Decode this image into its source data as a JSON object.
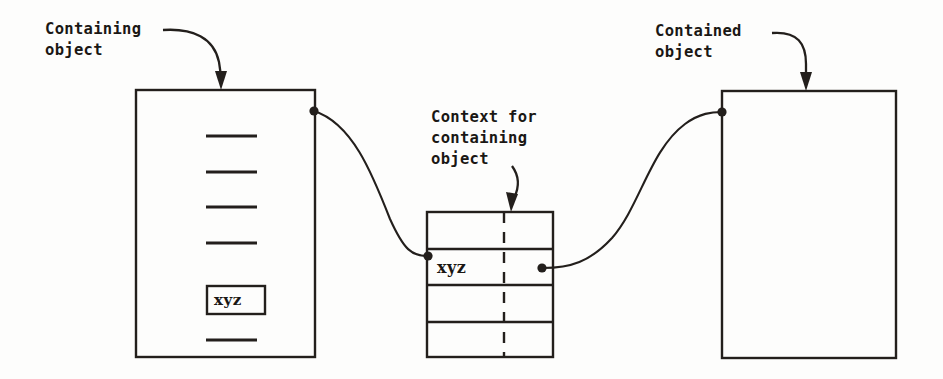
{
  "diagram": {
    "stroke_color": "#231f1c",
    "background_color": "#fdfdfc",
    "annotations": {
      "containing_object": "Containing\nobject",
      "containing_object_line1": "Containing",
      "containing_object_line2": "object",
      "context_for_containing_object": "Context for\ncontaining\nobject",
      "context_line1": "Context for",
      "context_line2": "containing",
      "context_line3": "object",
      "contained_object": "Contained\nobject",
      "contained_object_line1": "Contained",
      "contained_object_line2": "object"
    },
    "containing_object_box": {
      "name": "containing-object-box",
      "slots": [
        {
          "type": "dash",
          "label": ""
        },
        {
          "type": "dash",
          "label": ""
        },
        {
          "type": "dash",
          "label": ""
        },
        {
          "type": "dash",
          "label": ""
        },
        {
          "type": "boxed",
          "label": "xyz"
        },
        {
          "type": "dash",
          "label": ""
        }
      ]
    },
    "context_box": {
      "name": "context-box",
      "rows": [
        {
          "left": "",
          "right": ""
        },
        {
          "left": "xyz",
          "right": ""
        },
        {
          "left": "",
          "right": ""
        },
        {
          "left": "",
          "right": ""
        }
      ],
      "divider_style": "dashed"
    },
    "contained_object_box": {
      "name": "contained-object-box",
      "contents": ""
    },
    "connectors": [
      {
        "name": "containing-to-context",
        "from": "containing-object-box right edge",
        "to": "context-box row 2 left"
      },
      {
        "name": "context-to-contained",
        "from": "context-box row 2 right",
        "to": "contained-object-box left edge"
      }
    ]
  }
}
